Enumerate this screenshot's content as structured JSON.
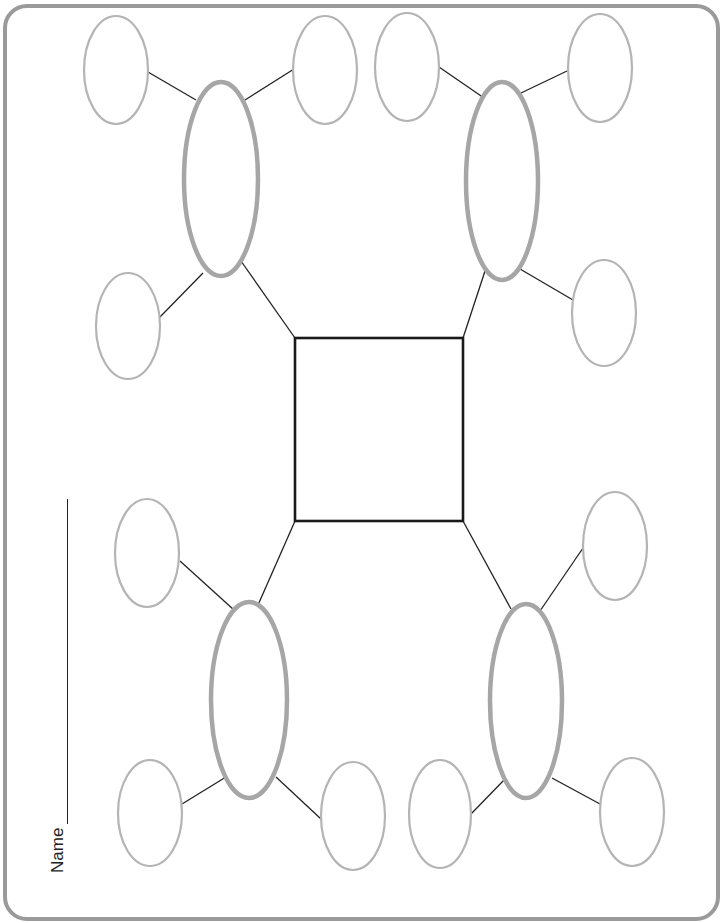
{
  "worksheet": {
    "name_label": "Name",
    "colors": {
      "frame": "#9a9a9a",
      "center_box": "#1a1a1a",
      "main_ellipse": "#a6a6a6",
      "detail_ellipse": "#b4b4b4",
      "connector": "#222222"
    },
    "center_box": {
      "x": 295,
      "y": 338,
      "w": 168,
      "h": 183
    },
    "branches": [
      {
        "id": "top-left",
        "main": {
          "cx": 221,
          "cy": 179,
          "rx": 37,
          "ry": 97
        },
        "details": [
          {
            "cx": 116,
            "cy": 70
          },
          {
            "cx": 325,
            "cy": 70
          },
          {
            "cx": 128,
            "cy": 326
          }
        ]
      },
      {
        "id": "top-right",
        "main": {
          "cx": 502,
          "cy": 181,
          "rx": 36,
          "ry": 99
        },
        "details": [
          {
            "cx": 407,
            "cy": 67
          },
          {
            "cx": 600,
            "cy": 68
          },
          {
            "cx": 604,
            "cy": 313
          }
        ]
      },
      {
        "id": "bottom-left",
        "main": {
          "cx": 249,
          "cy": 700,
          "rx": 38,
          "ry": 98
        },
        "details": [
          {
            "cx": 147,
            "cy": 553
          },
          {
            "cx": 150,
            "cy": 813
          },
          {
            "cx": 353,
            "cy": 816
          }
        ]
      },
      {
        "id": "bottom-right",
        "main": {
          "cx": 526,
          "cy": 701,
          "rx": 36,
          "ry": 97
        },
        "details": [
          {
            "cx": 615,
            "cy": 546
          },
          {
            "cx": 440,
            "cy": 814
          },
          {
            "cx": 632,
            "cy": 812
          }
        ]
      }
    ]
  }
}
